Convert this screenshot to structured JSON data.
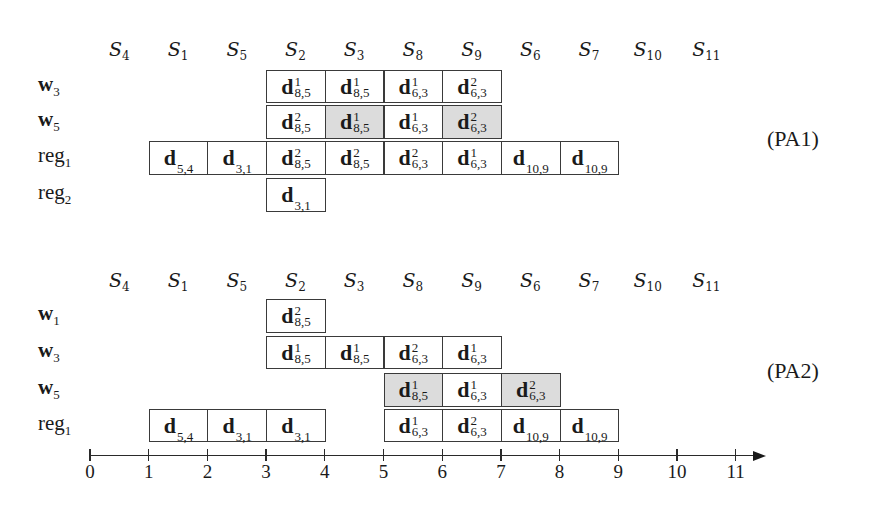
{
  "diagrams": [
    {
      "tag": "(PA1)",
      "header_y": 38,
      "stages": [
        {
          "base": "S",
          "sub": "4"
        },
        {
          "base": "S",
          "sub": "1"
        },
        {
          "base": "S",
          "sub": "5"
        },
        {
          "base": "S",
          "sub": "2"
        },
        {
          "base": "S",
          "sub": "3"
        },
        {
          "base": "S",
          "sub": "8"
        },
        {
          "base": "S",
          "sub": "9"
        },
        {
          "base": "S",
          "sub": "6"
        },
        {
          "base": "S",
          "sub": "7"
        },
        {
          "base": "S",
          "sub": "10"
        },
        {
          "base": "S",
          "sub": "11"
        }
      ],
      "rows": [
        {
          "label": "w",
          "label_sub": "3",
          "bold": true,
          "top": 70,
          "bottom": 103,
          "cells": [
            {
              "start": 3,
              "base": "d",
              "sup": "1",
              "sub": "8,5",
              "shaded": false
            },
            {
              "start": 4,
              "base": "d",
              "sup": "1",
              "sub": "8,5",
              "shaded": false
            },
            {
              "start": 5,
              "base": "d",
              "sup": "1",
              "sub": "6,3",
              "shaded": false
            },
            {
              "start": 6,
              "base": "d",
              "sup": "2",
              "sub": "6,3",
              "shaded": false
            }
          ]
        },
        {
          "label": "w",
          "label_sub": "5",
          "bold": true,
          "top": 105,
          "bottom": 139,
          "cells": [
            {
              "start": 3,
              "base": "d",
              "sup": "2",
              "sub": "8,5",
              "shaded": false
            },
            {
              "start": 4,
              "base": "d",
              "sup": "1",
              "sub": "8,5",
              "shaded": true
            },
            {
              "start": 5,
              "base": "d",
              "sup": "1",
              "sub": "6,3",
              "shaded": false
            },
            {
              "start": 6,
              "base": "d",
              "sup": "2",
              "sub": "6,3",
              "shaded": true
            }
          ]
        },
        {
          "label": "reg",
          "label_sub": "1",
          "bold": false,
          "top": 141,
          "bottom": 175,
          "cells": [
            {
              "start": 1,
              "base": "d",
              "sup": "",
              "sub": "5,4",
              "shaded": false
            },
            {
              "start": 2,
              "base": "d",
              "sup": "",
              "sub": "3,1",
              "shaded": false
            },
            {
              "start": 3,
              "base": "d",
              "sup": "2",
              "sub": "8,5",
              "shaded": false
            },
            {
              "start": 4,
              "base": "d",
              "sup": "2",
              "sub": "8,5",
              "shaded": false
            },
            {
              "start": 5,
              "base": "d",
              "sup": "2",
              "sub": "6,3",
              "shaded": false
            },
            {
              "start": 6,
              "base": "d",
              "sup": "1",
              "sub": "6,3",
              "shaded": false
            },
            {
              "start": 7,
              "base": "d",
              "sup": "",
              "sub": "10,9",
              "shaded": false
            },
            {
              "start": 8,
              "base": "d",
              "sup": "",
              "sub": "10,9",
              "shaded": false
            }
          ]
        },
        {
          "label": "reg",
          "label_sub": "2",
          "bold": false,
          "top": 178,
          "bottom": 212,
          "cells": [
            {
              "start": 3,
              "base": "d",
              "sup": "",
              "sub": "3,1",
              "shaded": false
            }
          ]
        }
      ],
      "tag_y": 126
    },
    {
      "tag": "(PA2)",
      "header_y": 269,
      "stages": [
        {
          "base": "S",
          "sub": "4"
        },
        {
          "base": "S",
          "sub": "1"
        },
        {
          "base": "S",
          "sub": "5"
        },
        {
          "base": "S",
          "sub": "2"
        },
        {
          "base": "S",
          "sub": "3"
        },
        {
          "base": "S",
          "sub": "8"
        },
        {
          "base": "S",
          "sub": "9"
        },
        {
          "base": "S",
          "sub": "6"
        },
        {
          "base": "S",
          "sub": "7"
        },
        {
          "base": "S",
          "sub": "10"
        },
        {
          "base": "S",
          "sub": "11"
        }
      ],
      "rows": [
        {
          "label": "w",
          "label_sub": "1",
          "bold": true,
          "top": 299,
          "bottom": 333,
          "cells": [
            {
              "start": 3,
              "base": "d",
              "sup": "2",
              "sub": "8,5",
              "shaded": false
            }
          ]
        },
        {
          "label": "w",
          "label_sub": "3",
          "bold": true,
          "top": 336,
          "bottom": 369,
          "cells": [
            {
              "start": 3,
              "base": "d",
              "sup": "1",
              "sub": "8,5",
              "shaded": false
            },
            {
              "start": 4,
              "base": "d",
              "sup": "1",
              "sub": "8,5",
              "shaded": false
            },
            {
              "start": 5,
              "base": "d",
              "sup": "2",
              "sub": "6,3",
              "shaded": false
            },
            {
              "start": 6,
              "base": "d",
              "sup": "1",
              "sub": "6,3",
              "shaded": false
            }
          ]
        },
        {
          "label": "w",
          "label_sub": "5",
          "bold": true,
          "top": 373,
          "bottom": 407,
          "cells": [
            {
              "start": 5,
              "base": "d",
              "sup": "1",
              "sub": "8,5",
              "shaded": true
            },
            {
              "start": 6,
              "base": "d",
              "sup": "1",
              "sub": "6,3",
              "shaded": false
            },
            {
              "start": 7,
              "base": "d",
              "sup": "2",
              "sub": "6,3",
              "shaded": true
            }
          ]
        },
        {
          "label": "reg",
          "label_sub": "1",
          "bold": false,
          "top": 409,
          "bottom": 442,
          "cells": [
            {
              "start": 1,
              "base": "d",
              "sup": "",
              "sub": "5,4",
              "shaded": false
            },
            {
              "start": 2,
              "base": "d",
              "sup": "",
              "sub": "3,1",
              "shaded": false
            },
            {
              "start": 3,
              "base": "d",
              "sup": "",
              "sub": "3,1",
              "shaded": false
            },
            {
              "start": 5,
              "base": "d",
              "sup": "1",
              "sub": "6,3",
              "shaded": false
            },
            {
              "start": 6,
              "base": "d",
              "sup": "2",
              "sub": "6,3",
              "shaded": false
            },
            {
              "start": 7,
              "base": "d",
              "sup": "",
              "sub": "10,9",
              "shaded": false
            },
            {
              "start": 8,
              "base": "d",
              "sup": "",
              "sub": "10,9",
              "shaded": false
            }
          ]
        }
      ],
      "tag_y": 358
    }
  ],
  "axis": {
    "y": 455,
    "ticks": [
      "0",
      "1",
      "2",
      "3",
      "4",
      "5",
      "6",
      "7",
      "8",
      "9",
      "10",
      "11"
    ],
    "x0": 90,
    "unit": 58.7,
    "arrow_end": 766
  },
  "colors": {
    "shaded": "#dcdcdc",
    "border": "#3a3a3a",
    "text": "#1a1a1a"
  }
}
